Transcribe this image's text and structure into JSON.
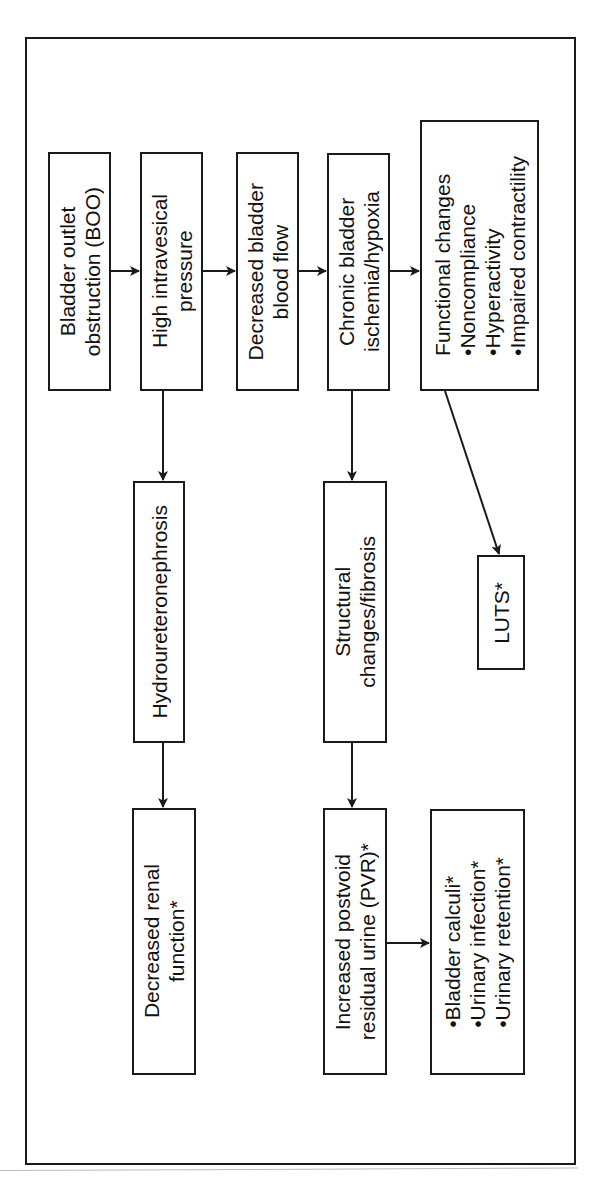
{
  "diagram": {
    "nodes": {
      "boo": {
        "lines": [
          "Bladder outlet",
          "obstruction (BOO)"
        ]
      },
      "pressure": {
        "lines": [
          "High intravesical",
          "pressure"
        ]
      },
      "bloodflow": {
        "lines": [
          "Decreased bladder",
          "blood flow"
        ]
      },
      "ischemia": {
        "lines": [
          "Chronic bladder",
          "ischemia/hypoxia"
        ]
      },
      "functional": {
        "title": "Functional changes",
        "bullets": [
          "Noncompliance",
          "Hyperactivity",
          "Impaired contractility"
        ]
      },
      "hydro": {
        "lines": [
          "Hydroureteronephrosis"
        ]
      },
      "structural": {
        "lines": [
          "Structural",
          "changes/fibrosis"
        ]
      },
      "luts": {
        "lines": [
          "LUTS*"
        ]
      },
      "renal": {
        "lines": [
          "Decreased renal",
          "function*"
        ]
      },
      "pvr": {
        "lines": [
          "Increased postvoid",
          "residual urine (PVR)*"
        ]
      },
      "complications": {
        "bullets": [
          "Bladder calculi*",
          "Urinary infection*",
          "Urinary retention*"
        ]
      }
    },
    "edges": [
      [
        "boo",
        "pressure"
      ],
      [
        "pressure",
        "bloodflow"
      ],
      [
        "bloodflow",
        "ischemia"
      ],
      [
        "ischemia",
        "functional"
      ],
      [
        "pressure",
        "hydro"
      ],
      [
        "hydro",
        "renal"
      ],
      [
        "ischemia",
        "structural"
      ],
      [
        "structural",
        "pvr"
      ],
      [
        "pvr",
        "complications"
      ],
      [
        "functional",
        "luts"
      ]
    ],
    "colors": {
      "stroke": "#1a1a1a",
      "background": "#ffffff"
    }
  }
}
